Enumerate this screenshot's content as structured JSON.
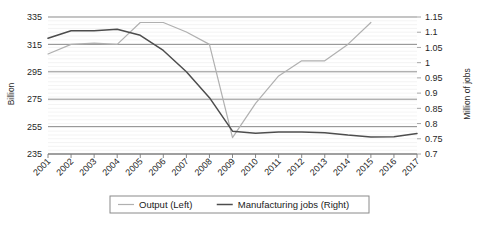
{
  "chart_data": {
    "type": "line",
    "title": "",
    "x": [
      2001,
      2002,
      2003,
      2004,
      2005,
      2006,
      2007,
      2008,
      2009,
      2010,
      2011,
      2012,
      2013,
      2014,
      2015,
      2016,
      2017
    ],
    "xlabel": "",
    "xtick_labels": [
      "2001",
      "2002",
      "2003",
      "2004",
      "2005",
      "2006",
      "2007",
      "2008",
      "2009",
      "2010",
      "2011",
      "2012",
      "2013",
      "2014",
      "2015",
      "2016",
      "2017"
    ],
    "grid": true,
    "legend_position": "bottom",
    "axes": [
      {
        "id": "left",
        "label": "Billion",
        "ylim": [
          235,
          335
        ],
        "ticks": [
          235,
          255,
          275,
          295,
          315,
          335
        ],
        "tick_labels": [
          "235",
          "255",
          "275",
          "295",
          "315",
          "335"
        ]
      },
      {
        "id": "right",
        "label": "Million of jobs",
        "ylim": [
          0.7,
          1.15
        ],
        "ticks": [
          0.7,
          0.75,
          0.8,
          0.85,
          0.9,
          0.95,
          1,
          1.05,
          1.1,
          1.15
        ],
        "tick_labels": [
          "0.7",
          "0.75",
          "0.8",
          "0.85",
          "0.9",
          "0.95",
          "1",
          "1.05",
          "1.1",
          "1.15"
        ]
      }
    ],
    "series": [
      {
        "name": "Output (Left)",
        "axis": "left",
        "color": "#b0b0b0",
        "values": [
          308,
          315,
          316,
          315,
          331,
          331,
          324,
          315,
          247,
          272,
          292,
          303,
          303,
          315,
          331,
          null,
          null
        ]
      },
      {
        "name": "Manufacturing jobs (Right)",
        "axis": "right",
        "color": "#4d4d4d",
        "values": [
          1.08,
          1.105,
          1.105,
          1.11,
          1.09,
          1.04,
          0.97,
          0.885,
          0.775,
          0.768,
          0.772,
          0.772,
          0.77,
          0.762,
          0.756,
          0.757,
          0.767
        ]
      }
    ],
    "legend": [
      {
        "label": "Output (Left)",
        "color": "#b0b0b0"
      },
      {
        "label": "Manufacturing jobs (Right)",
        "color": "#4d4d4d"
      }
    ]
  }
}
